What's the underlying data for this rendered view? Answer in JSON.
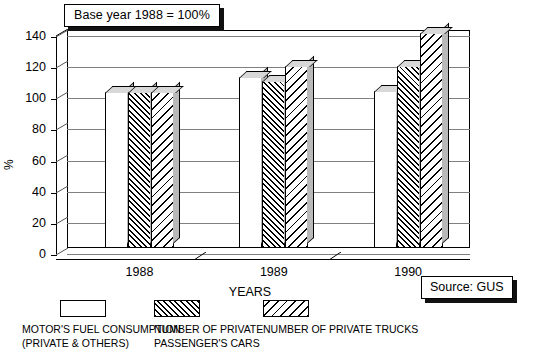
{
  "title_box": {
    "text": "Base year 1988 = 100%"
  },
  "source_box": {
    "text": "Source: GUS"
  },
  "axes": {
    "ylabel": "%",
    "xlabel": "YEARS",
    "yticks": [
      "140",
      "120",
      "100",
      "80",
      "60",
      "40",
      "20",
      "0"
    ]
  },
  "legend": {
    "items": [
      {
        "label_line1": "MOTOR'S FUEL CONSUMPTION",
        "label_line2": "(PRIVATE & OTHERS)",
        "pattern": "solid-white"
      },
      {
        "label_line1": "NUMBER OF PRIVATE",
        "label_line2": "PASSENGER'S CARS",
        "pattern": "hatch-dense"
      },
      {
        "label_line1": "NUMBER OF PRIVATE TRUCKS",
        "label_line2": "",
        "pattern": "hatch-sparse"
      }
    ]
  },
  "chart_data": {
    "type": "bar",
    "title": "Base year 1988 = 100%",
    "xlabel": "YEARS",
    "ylabel": "%",
    "ylim": [
      0,
      140
    ],
    "ytick_step": 20,
    "grid": true,
    "legend_position": "below",
    "categories": [
      "1988",
      "1989",
      "1990"
    ],
    "series": [
      {
        "name": "MOTOR'S FUEL CONSUMPTION (PRIVATE & OTHERS)",
        "values": [
          100,
          110,
          101
        ]
      },
      {
        "name": "NUMBER OF PRIVATE PASSENGER'S CARS",
        "values": [
          100,
          107,
          117
        ]
      },
      {
        "name": "NUMBER OF PRIVATE TRUCKS",
        "values": [
          100,
          117,
          138
        ]
      }
    ],
    "annotations": [
      "Base year 1988 = 100%",
      "Source: GUS"
    ]
  }
}
